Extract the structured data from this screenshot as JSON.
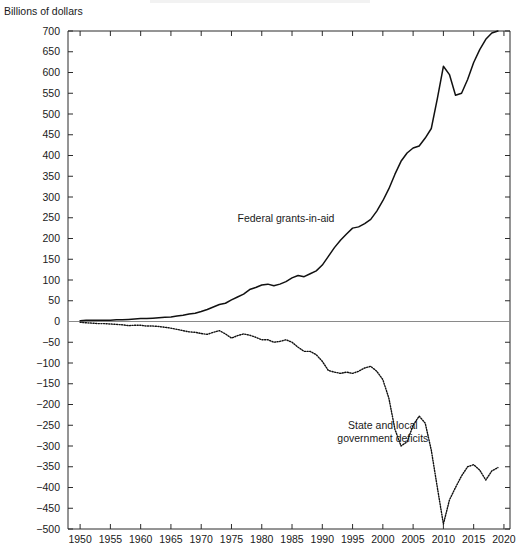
{
  "figure": {
    "axis_title": "Billions of dollars",
    "background_color": "#ffffff",
    "line_color": "#111111",
    "zero_line_color": "#8a8a8a"
  },
  "chart_data": {
    "type": "line",
    "title": "",
    "subtitle": "",
    "xlabel": "",
    "ylabel": "Billions of dollars",
    "xlim": [
      1948,
      2021
    ],
    "ylim": [
      -500,
      700
    ],
    "ytick_step": 50,
    "xtick_step": 5,
    "grid": false,
    "legend": "inline-annotations",
    "xticks": [
      1950,
      1955,
      1960,
      1965,
      1970,
      1975,
      1980,
      1985,
      1990,
      1995,
      2000,
      2005,
      2010,
      2015,
      2020
    ],
    "yticks": [
      700,
      650,
      600,
      550,
      500,
      450,
      400,
      350,
      300,
      250,
      200,
      150,
      100,
      50,
      0,
      -50,
      -100,
      -150,
      -200,
      -250,
      -300,
      -350,
      -400,
      -450,
      -500
    ],
    "annotations": [
      {
        "text": "Federal grants-in-aid",
        "x": 1992,
        "y": 240
      },
      {
        "text": "State and local government deficits",
        "x": 2000,
        "y": -260
      }
    ],
    "series": [
      {
        "name": "Federal grants-in-aid",
        "style": "solid",
        "x": [
          1950,
          1951,
          1952,
          1953,
          1954,
          1955,
          1956,
          1957,
          1958,
          1959,
          1960,
          1961,
          1962,
          1963,
          1964,
          1965,
          1966,
          1967,
          1968,
          1969,
          1970,
          1971,
          1972,
          1973,
          1974,
          1975,
          1976,
          1977,
          1978,
          1979,
          1980,
          1981,
          1982,
          1983,
          1984,
          1985,
          1986,
          1987,
          1988,
          1989,
          1990,
          1991,
          1992,
          1993,
          1994,
          1995,
          1996,
          1997,
          1998,
          1999,
          2000,
          2001,
          2002,
          2003,
          2004,
          2005,
          2006,
          2007,
          2008,
          2009,
          2010,
          2011,
          2012,
          2013,
          2014,
          2015,
          2016,
          2017,
          2018,
          2019
        ],
        "values": [
          2,
          3,
          3,
          3,
          3,
          3,
          4,
          4,
          5,
          6,
          7,
          7,
          8,
          9,
          10,
          11,
          13,
          15,
          18,
          20,
          24,
          29,
          35,
          41,
          44,
          52,
          59,
          66,
          77,
          82,
          88,
          90,
          86,
          90,
          96,
          105,
          111,
          108,
          115,
          122,
          136,
          157,
          178,
          196,
          211,
          225,
          228,
          236,
          246,
          266,
          291,
          320,
          355,
          386,
          406,
          418,
          423,
          442,
          465,
          537,
          615,
          595,
          545,
          550,
          583,
          624,
          655,
          680,
          695,
          700
        ]
      },
      {
        "name": "State and local government deficits",
        "style": "dotted",
        "x": [
          1950,
          1951,
          1952,
          1953,
          1954,
          1955,
          1956,
          1957,
          1958,
          1959,
          1960,
          1961,
          1962,
          1963,
          1964,
          1965,
          1966,
          1967,
          1968,
          1969,
          1970,
          1971,
          1972,
          1973,
          1974,
          1975,
          1976,
          1977,
          1978,
          1979,
          1980,
          1981,
          1982,
          1983,
          1984,
          1985,
          1986,
          1987,
          1988,
          1989,
          1990,
          1991,
          1992,
          1993,
          1994,
          1995,
          1996,
          1997,
          1998,
          1999,
          2000,
          2001,
          2002,
          2003,
          2004,
          2005,
          2006,
          2007,
          2008,
          2009,
          2010,
          2011,
          2012,
          2013,
          2014,
          2015,
          2016,
          2017,
          2018,
          2019
        ],
        "values": [
          -2,
          -3,
          -4,
          -5,
          -5,
          -6,
          -7,
          -8,
          -10,
          -9,
          -9,
          -11,
          -11,
          -12,
          -14,
          -16,
          -19,
          -22,
          -25,
          -26,
          -29,
          -31,
          -26,
          -22,
          -30,
          -40,
          -34,
          -30,
          -33,
          -38,
          -44,
          -44,
          -50,
          -48,
          -44,
          -50,
          -62,
          -72,
          -72,
          -80,
          -96,
          -118,
          -122,
          -125,
          -122,
          -125,
          -120,
          -112,
          -108,
          -120,
          -140,
          -185,
          -260,
          -300,
          -290,
          -250,
          -228,
          -245,
          -310,
          -400,
          -488,
          -430,
          -400,
          -372,
          -350,
          -345,
          -358,
          -382,
          -360,
          -352
        ]
      }
    ]
  }
}
